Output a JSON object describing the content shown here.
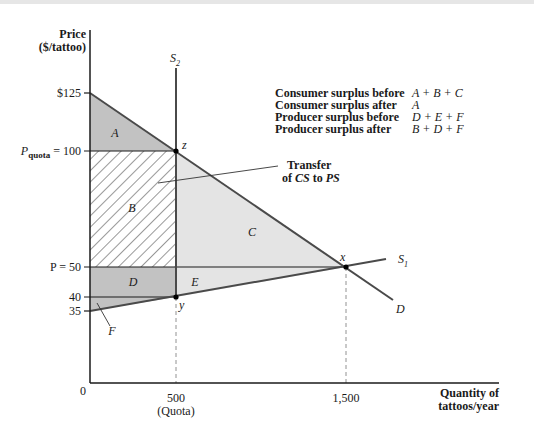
{
  "axes": {
    "y_label_line1": "Price",
    "y_label_line2": "($/tattoo)",
    "x_label_line1": "Quantity of",
    "x_label_line2": "tattoos/year",
    "origin": "0",
    "y_ticks": {
      "p125": "$125",
      "p100_prefix": "P",
      "p100_sub": "quota",
      "p100_suffix": " = 100",
      "p50": "P = 50",
      "p40": "40",
      "p35": "35"
    },
    "x_ticks": {
      "q500": "500",
      "q500_note": "(Quota)",
      "q1500": "1,500"
    }
  },
  "curves": {
    "s2_label": "S",
    "s2_sub": "2",
    "s1_label": "S",
    "s1_sub": "1",
    "d_label": "D"
  },
  "points": {
    "z": "z",
    "x": "x",
    "y": "y"
  },
  "regions": {
    "A": "A",
    "B": "B",
    "C": "C",
    "D": "D",
    "E": "E",
    "F": "F"
  },
  "annotation": {
    "line1": "Transfer",
    "line2_pre": "of ",
    "line2_cs": "CS",
    "line2_mid": " to ",
    "line2_ps": "PS"
  },
  "legend": {
    "rows": [
      {
        "label": "Consumer surplus before",
        "value": "A + B + C"
      },
      {
        "label": "Consumer surplus after",
        "value": "A"
      },
      {
        "label": "Producer surplus before",
        "value": "D + E + F"
      },
      {
        "label": "Producer surplus after",
        "value": "B + D + F"
      }
    ]
  },
  "colors": {
    "dark_shade": "#c2c2c2",
    "light_shade": "#e4e4e4",
    "curve": "#4a4a4a",
    "axis": "#1a1a1a"
  }
}
